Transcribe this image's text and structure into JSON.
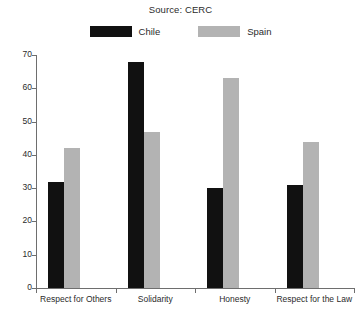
{
  "chart_data": {
    "type": "bar",
    "title": "Source: CERC",
    "xlabel": "",
    "ylabel": "",
    "ylim": [
      0,
      70
    ],
    "yticks": [
      0,
      10,
      20,
      30,
      40,
      50,
      60,
      70
    ],
    "grid": false,
    "legend_position": "top-center",
    "categories": [
      "Respect for Others",
      "Solidarity",
      "Honesty",
      "Respect for the Law"
    ],
    "series": [
      {
        "name": "Chile",
        "color": "#111111",
        "values": [
          32,
          68,
          30,
          31
        ]
      },
      {
        "name": "Spain",
        "color": "#b3b3b3",
        "values": [
          42,
          47,
          63,
          44
        ]
      }
    ]
  }
}
